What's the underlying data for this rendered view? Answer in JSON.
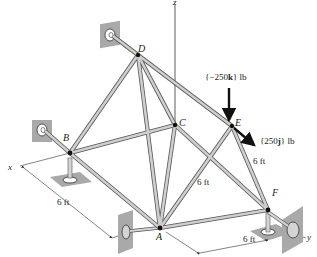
{
  "figure": {
    "type": "space-truss",
    "nodes": {
      "A": {
        "label": "A"
      },
      "B": {
        "label": "B"
      },
      "C": {
        "label": "C"
      },
      "D": {
        "label": "D"
      },
      "E": {
        "label": "E"
      },
      "F": {
        "label": "F"
      }
    },
    "axes": {
      "x": "x",
      "y": "y",
      "z": "z"
    },
    "loads": [
      {
        "at": "E",
        "text_open": "{−250",
        "vec": "k",
        "text_close": "} lb",
        "direction": "down"
      },
      {
        "at": "E",
        "text_open": "{250",
        "vec": "j",
        "text_close": "} lb",
        "direction": "down-right"
      }
    ],
    "dimensions": [
      {
        "label": "6 ft",
        "between": "B-A (along x)"
      },
      {
        "label": "6 ft",
        "between": "A-F (along y)"
      },
      {
        "label": "6 ft",
        "member": "C-A diagonal"
      },
      {
        "label": "6 ft",
        "member": "E-F"
      }
    ],
    "members": [
      "D-B",
      "D-C",
      "D-A",
      "D-E",
      "B-C",
      "B-A",
      "C-A",
      "C-F",
      "E-A",
      "E-F",
      "A-F"
    ],
    "supports": [
      "D",
      "B",
      "A",
      "F"
    ],
    "colors": {
      "member_fill": "#c8c8c8",
      "member_edge": "#555555",
      "support_plate": "#a9a9a9",
      "load_arrow": "#111111"
    }
  }
}
